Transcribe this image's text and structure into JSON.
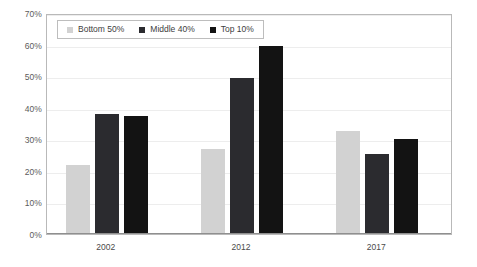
{
  "chart_data": {
    "type": "bar",
    "title": "",
    "subtitle": "",
    "xlabel": "",
    "ylabel": "",
    "categories": [
      "2002",
      "2012",
      "2017"
    ],
    "series": [
      {
        "name": "Bottom 50%",
        "color": "#d2d2d2",
        "values": [
          22.0,
          27.0,
          32.5
        ]
      },
      {
        "name": "Middle 40%",
        "color": "#2b2b2f",
        "values": [
          38.0,
          49.5,
          25.5
        ]
      },
      {
        "name": "Top 10%",
        "color": "#131313",
        "values": [
          37.5,
          59.5,
          30.0
        ]
      }
    ],
    "ylim": [
      0,
      70
    ],
    "ytick_step": 10,
    "ytick_labels": [
      "0%",
      "10%",
      "20%",
      "30%",
      "40%",
      "50%",
      "60%",
      "70%"
    ],
    "ytick_values": [
      0,
      10,
      20,
      30,
      40,
      50,
      60,
      70
    ],
    "grid": true,
    "grid_axis": "y",
    "legend_position": "top-left",
    "value_suffix": "%"
  },
  "colors": {
    "plot_border": "#b9b9b9",
    "gridline": "#ededed",
    "baseline": "#8f8f8f",
    "background": "#ffffff",
    "tick_text": "#5c5c5c"
  }
}
